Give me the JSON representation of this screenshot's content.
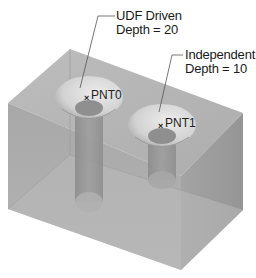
{
  "figure": {
    "colors": {
      "background": "#ffffff",
      "top_face": "#b5b5b5",
      "front_face": "#a6a6a6",
      "right_face": "#9c9c9c",
      "hole_counterbore": "#d6d6d6",
      "hole_shaft": "#8f8f8f",
      "leader_line": "#555555",
      "text": "#1a1a1a"
    }
  },
  "callouts": [
    {
      "id": "udf-driven",
      "line1": "UDF Driven",
      "line2": "Depth = 20",
      "target_point": "PNT0"
    },
    {
      "id": "independent",
      "line1": "Independent",
      "line2": "Depth = 10",
      "target_point": "PNT1"
    }
  ],
  "points": [
    {
      "label": "PNT0",
      "marker": "×"
    },
    {
      "label": "PNT1",
      "marker": "×"
    }
  ]
}
